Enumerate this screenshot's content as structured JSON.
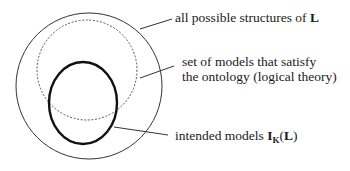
{
  "diagram": {
    "type": "nested-set-diagram",
    "shapes": [
      {
        "id": "all-structures",
        "shape": "circle",
        "style": "thin-solid",
        "label_ref": "labels.0"
      },
      {
        "id": "ontology-models",
        "shape": "circle",
        "style": "dashed",
        "label_ref": "labels.1"
      },
      {
        "id": "intended-models",
        "shape": "ellipse",
        "style": "thick-solid",
        "label_ref": "labels.2"
      }
    ],
    "labels": [
      {
        "text": "all possible structures of ",
        "bold_suffix": "L"
      },
      {
        "line1": "set of models that satisfy",
        "line2": "the ontology (logical theory)"
      },
      {
        "text": "intended models ",
        "bold_main": "I",
        "subscript": "K",
        "paren_open": "(",
        "bold_arg": "L",
        "paren_close": ")"
      }
    ],
    "colors": {
      "stroke": "#222222",
      "background": "#ffffff"
    }
  }
}
